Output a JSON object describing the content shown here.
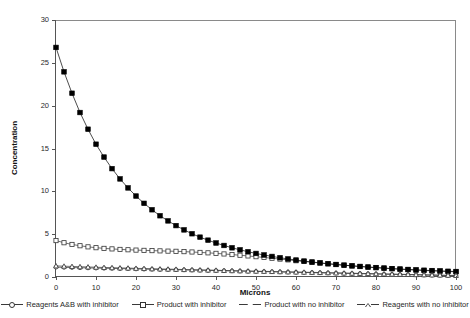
{
  "chart_data": {
    "type": "line",
    "title": "",
    "xlabel": "Microns",
    "ylabel": "Concentration",
    "xlim": [
      0,
      100
    ],
    "ylim": [
      0,
      30
    ],
    "xticks": [
      0,
      10,
      20,
      30,
      40,
      50,
      60,
      70,
      80,
      90,
      100
    ],
    "yticks": [
      0,
      5,
      10,
      15,
      20,
      25,
      30
    ],
    "grid": false,
    "legend_position": "below",
    "x": [
      0,
      2,
      4,
      6,
      8,
      10,
      12,
      14,
      16,
      18,
      20,
      22,
      24,
      26,
      28,
      30,
      32,
      34,
      36,
      38,
      40,
      42,
      44,
      46,
      48,
      50,
      52,
      54,
      56,
      58,
      60,
      62,
      64,
      66,
      68,
      70,
      72,
      74,
      76,
      78,
      80,
      82,
      84,
      86,
      88,
      90,
      92,
      94,
      96,
      98,
      100
    ],
    "series": [
      {
        "name": "Reagents A&B with inhibitor",
        "marker": "circle-open",
        "color": "#333333",
        "values": [
          1.15,
          1.12,
          1.1,
          1.08,
          1.06,
          1.04,
          1.02,
          1.0,
          0.98,
          0.96,
          0.94,
          0.92,
          0.9,
          0.88,
          0.86,
          0.85,
          0.83,
          0.81,
          0.79,
          0.77,
          0.75,
          0.73,
          0.71,
          0.69,
          0.67,
          0.65,
          0.63,
          0.61,
          0.59,
          0.57,
          0.55,
          0.53,
          0.51,
          0.49,
          0.47,
          0.45,
          0.43,
          0.41,
          0.39,
          0.37,
          0.35,
          0.33,
          0.31,
          0.29,
          0.27,
          0.25,
          0.23,
          0.21,
          0.19,
          0.17,
          0.15
        ]
      },
      {
        "name": "Product with inhibitor",
        "marker": "square-open",
        "color": "#333333",
        "values": [
          4.25,
          4.0,
          3.8,
          3.65,
          3.52,
          3.42,
          3.34,
          3.28,
          3.22,
          3.18,
          3.14,
          3.11,
          3.08,
          3.05,
          3.02,
          3.0,
          2.96,
          2.92,
          2.87,
          2.82,
          2.76,
          2.69,
          2.62,
          2.54,
          2.46,
          2.37,
          2.28,
          2.19,
          2.09,
          2.0,
          1.9,
          1.81,
          1.72,
          1.63,
          1.54,
          1.46,
          1.38,
          1.3,
          1.23,
          1.16,
          1.09,
          1.03,
          0.97,
          0.91,
          0.86,
          0.81,
          0.76,
          0.72,
          0.68,
          0.64,
          0.6
        ]
      },
      {
        "name": "Product with no inhibitor",
        "marker": "square-filled",
        "color": "#000000",
        "values": [
          26.8,
          23.95,
          21.45,
          19.2,
          17.25,
          15.5,
          14.0,
          12.65,
          11.45,
          10.4,
          9.45,
          8.6,
          7.85,
          7.15,
          6.55,
          6.0,
          5.5,
          5.05,
          4.65,
          4.3,
          3.97,
          3.68,
          3.41,
          3.17,
          2.95,
          2.75,
          2.57,
          2.4,
          2.25,
          2.11,
          1.98,
          1.86,
          1.75,
          1.65,
          1.55,
          1.46,
          1.38,
          1.3,
          1.23,
          1.16,
          1.1,
          1.04,
          0.98,
          0.93,
          0.88,
          0.83,
          0.79,
          0.75,
          0.71,
          0.67,
          0.64
        ]
      },
      {
        "name": "Reagents with no inhibitor",
        "marker": "triangle-open",
        "color": "#333333",
        "values": [
          1.3,
          1.26,
          1.23,
          1.2,
          1.17,
          1.14,
          1.11,
          1.09,
          1.06,
          1.04,
          1.01,
          0.99,
          0.96,
          0.94,
          0.92,
          0.9,
          0.87,
          0.85,
          0.83,
          0.81,
          0.79,
          0.76,
          0.74,
          0.72,
          0.7,
          0.68,
          0.66,
          0.64,
          0.62,
          0.6,
          0.58,
          0.56,
          0.54,
          0.52,
          0.5,
          0.48,
          0.46,
          0.44,
          0.42,
          0.4,
          0.38,
          0.36,
          0.34,
          0.32,
          0.3,
          0.28,
          0.26,
          0.24,
          0.22,
          0.2,
          0.18
        ]
      }
    ]
  }
}
